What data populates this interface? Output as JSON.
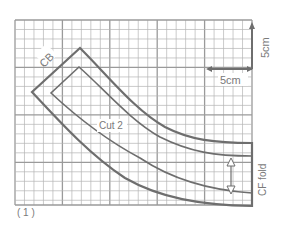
{
  "figure": {
    "type": "sewing pattern draft on grid",
    "labels": {
      "cb": "CB",
      "cut": "Cut 2",
      "cf_fold": "CF fold",
      "scale_h": "5cm",
      "scale_v": "5cm",
      "figure_number": "( 1 )"
    },
    "grid": {
      "major_unit_cm": 5,
      "minor_unit_cm": 1,
      "columns_cm": 25,
      "rows_cm": 19.5
    },
    "colors": {
      "grid": "#b5b5b5",
      "grid_major": "#9a9a9a",
      "outline": "#6e6e6e",
      "text": "#7a7a7a"
    }
  }
}
